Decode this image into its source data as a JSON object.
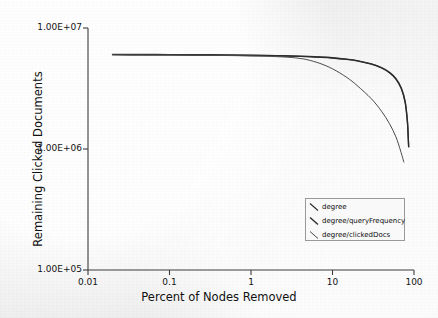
{
  "chart_data": {
    "type": "line",
    "title": "",
    "xlabel": "Percent of Nodes Removed",
    "ylabel": "Remaining Clicked Documents",
    "xscale": "log",
    "yscale": "log",
    "xlim": [
      0.01,
      100
    ],
    "ylim": [
      100000,
      10000000
    ],
    "xticks": [
      0.01,
      0.1,
      1,
      10,
      100
    ],
    "xtick_labels": [
      "0.01",
      "0.1",
      "1",
      "10",
      "100"
    ],
    "yticks": [
      100000,
      1000000,
      10000000
    ],
    "ytick_labels": [
      "1.00E+05",
      "1.00E+06",
      "1.00E+07"
    ],
    "grid": false,
    "legend_position": "lower right",
    "series": [
      {
        "name": "degree",
        "color": "#3a3a3a",
        "x": [
          0.02,
          0.05,
          0.1,
          0.3,
          1,
          2,
          4,
          7,
          10,
          15,
          20,
          30,
          40,
          50,
          60,
          70,
          78,
          83,
          85,
          86
        ],
        "y": [
          6050000,
          6040000,
          6030000,
          6010000,
          5960000,
          5920000,
          5850000,
          5760000,
          5680000,
          5530000,
          5380000,
          5050000,
          4700000,
          4300000,
          3820000,
          3180000,
          2450000,
          1700000,
          1250000,
          1050000
        ]
      },
      {
        "name": "degree/queryFrequency",
        "color": "#2b2b2b",
        "x": [
          0.02,
          0.05,
          0.1,
          0.3,
          1,
          2,
          4,
          7,
          10,
          15,
          20,
          30,
          40,
          50,
          60,
          70,
          78,
          83,
          85,
          86
        ],
        "y": [
          6020000,
          6010000,
          6000000,
          5980000,
          5930000,
          5890000,
          5820000,
          5730000,
          5650000,
          5500000,
          5350000,
          5020000,
          4670000,
          4270000,
          3790000,
          3150000,
          2420000,
          1680000,
          1240000,
          1040000
        ]
      },
      {
        "name": "degree/clickedDocs",
        "color": "#4a4a4a",
        "x": [
          0.02,
          0.05,
          0.1,
          0.3,
          1,
          2,
          3,
          4,
          5,
          7,
          10,
          15,
          20,
          30,
          40,
          50,
          60,
          68,
          72,
          75
        ],
        "y": [
          6000000,
          5990000,
          5980000,
          5950000,
          5880000,
          5800000,
          5720000,
          5600000,
          5450000,
          5100000,
          4600000,
          3900000,
          3350000,
          2600000,
          2050000,
          1620000,
          1260000,
          980000,
          860000,
          780000
        ]
      }
    ]
  },
  "axes": {
    "x_title": "Percent of Nodes Removed",
    "y_title": "Remaining Clicked Documents"
  },
  "legend": {
    "entries": [
      {
        "label": "degree"
      },
      {
        "label": "degree/queryFrequency"
      },
      {
        "label": "degree/clickedDocs"
      }
    ]
  },
  "colors": {
    "background": "#f2f2f2",
    "axis": "#3c3c3c",
    "text": "#111111",
    "curve_primary": "#2b2b2b",
    "curve_secondary": "#4a4a4a"
  }
}
